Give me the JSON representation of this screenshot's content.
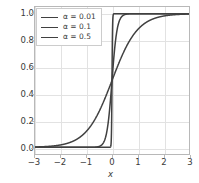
{
  "chart_data": {
    "type": "line",
    "title": "",
    "xlabel": "x",
    "ylabel": "",
    "xlim": [
      -3,
      3
    ],
    "ylim": [
      -0.05,
      1.05
    ],
    "grid": true,
    "legend_position": "upper left",
    "xticks": [
      "−3",
      "−2",
      "−1",
      "0",
      "1",
      "2",
      "3"
    ],
    "xtick_values": [
      -3,
      -2,
      -1,
      0,
      1,
      2,
      3
    ],
    "yticks": [
      "0.0",
      "0.2",
      "0.4",
      "0.6",
      "0.8",
      "1.0"
    ],
    "ytick_values": [
      0.0,
      0.2,
      0.4,
      0.6,
      0.8,
      1.0
    ],
    "series": [
      {
        "name": "α = 0.01",
        "alpha": 0.01,
        "color": "#404040",
        "x": [
          -3.0,
          -2.5,
          -2.0,
          -1.5,
          -1.0,
          -0.5,
          -0.2,
          -0.1,
          -0.05,
          -0.02,
          -0.01,
          0.0,
          0.01,
          0.02,
          0.05,
          0.1,
          0.2,
          0.5,
          1.0,
          1.5,
          2.0,
          2.5,
          3.0
        ],
        "values": [
          0.0,
          0.0,
          0.0,
          0.0,
          0.0,
          0.0,
          0.0,
          0.0,
          0.007,
          0.119,
          0.269,
          0.5,
          0.731,
          0.881,
          0.993,
          1.0,
          1.0,
          1.0,
          1.0,
          1.0,
          1.0,
          1.0,
          1.0
        ]
      },
      {
        "name": "α = 0.1",
        "alpha": 0.1,
        "color": "#404040",
        "x": [
          -3.0,
          -2.5,
          -2.0,
          -1.5,
          -1.0,
          -0.8,
          -0.6,
          -0.5,
          -0.4,
          -0.3,
          -0.2,
          -0.1,
          0.0,
          0.1,
          0.2,
          0.3,
          0.4,
          0.5,
          0.6,
          0.8,
          1.0,
          1.5,
          2.0,
          2.5,
          3.0
        ],
        "values": [
          0.0,
          0.0,
          0.0,
          0.0,
          5e-05,
          0.0003,
          0.0025,
          0.0067,
          0.018,
          0.047,
          0.119,
          0.269,
          0.5,
          0.731,
          0.881,
          0.953,
          0.982,
          0.993,
          0.998,
          0.9997,
          0.99995,
          1.0,
          1.0,
          1.0,
          1.0
        ]
      },
      {
        "name": "α = 0.5",
        "alpha": 0.5,
        "color": "#404040",
        "x": [
          -3.0,
          -2.5,
          -2.0,
          -1.5,
          -1.0,
          -0.5,
          0.0,
          0.5,
          1.0,
          1.5,
          2.0,
          2.5,
          3.0
        ],
        "values": [
          0.0025,
          0.0067,
          0.018,
          0.047,
          0.119,
          0.269,
          0.5,
          0.731,
          0.881,
          0.953,
          0.982,
          0.993,
          0.9975
        ]
      }
    ]
  }
}
